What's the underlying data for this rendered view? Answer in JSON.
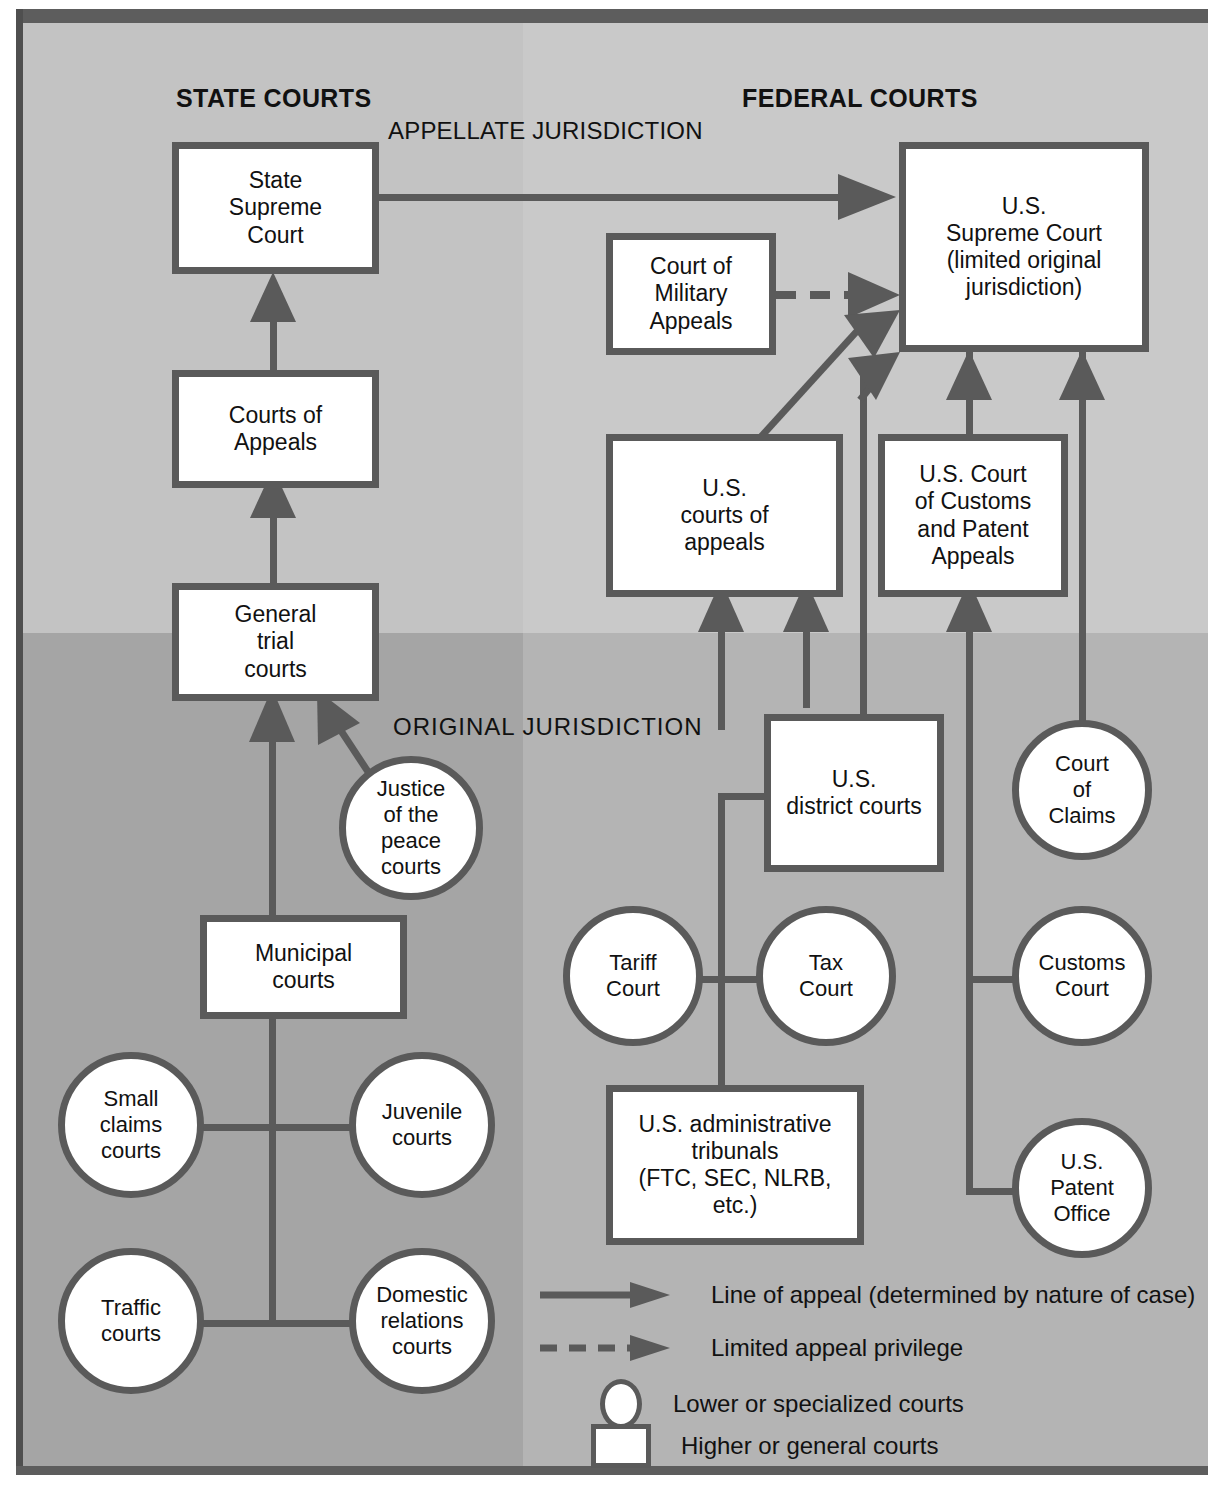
{
  "diagram": {
    "headers": {
      "state": "STATE COURTS",
      "federal": "FEDERAL COURTS",
      "appellate": "APPELLATE JURISDICTION",
      "original": "ORIGINAL JURISDICTION"
    },
    "colors": {
      "node_border": "#5a5a5a",
      "node_fill": "#ffffff",
      "bg_appellate_state": "#c3c3c3",
      "bg_appellate_federal": "#c9c9c9",
      "bg_original_state": "#a5a5a5",
      "bg_original_federal": "#b4b4b4",
      "frame": "#5d5d5d",
      "text": "#111111"
    },
    "state_nodes": [
      {
        "id": "state-supreme-court",
        "label": "State\nSupreme\nCourt",
        "shape": "box"
      },
      {
        "id": "courts-of-appeals",
        "label": "Courts of\nAppeals",
        "shape": "box"
      },
      {
        "id": "general-trial-courts",
        "label": "General\ntrial\ncourts",
        "shape": "box"
      },
      {
        "id": "justice-of-the-peace",
        "label": "Justice\nof the\npeace\ncourts",
        "shape": "circle"
      },
      {
        "id": "municipal-courts",
        "label": "Municipal\ncourts",
        "shape": "box"
      },
      {
        "id": "small-claims-courts",
        "label": "Small\nclaims\ncourts",
        "shape": "circle"
      },
      {
        "id": "juvenile-courts",
        "label": "Juvenile\ncourts",
        "shape": "circle"
      },
      {
        "id": "traffic-courts",
        "label": "Traffic\ncourts",
        "shape": "circle"
      },
      {
        "id": "domestic-relations",
        "label": "Domestic\nrelations\ncourts",
        "shape": "circle"
      }
    ],
    "federal_nodes": [
      {
        "id": "us-supreme-court",
        "label": "U.S.\nSupreme Court\n(limited original\njurisdiction)",
        "shape": "box"
      },
      {
        "id": "court-military-appeals",
        "label": "Court of\nMilitary\nAppeals",
        "shape": "box"
      },
      {
        "id": "us-courts-of-appeals",
        "label": "U.S.\ncourts of\nappeals",
        "shape": "box"
      },
      {
        "id": "us-court-customs-patent",
        "label": "U.S. Court\nof Customs\nand Patent\nAppeals",
        "shape": "box"
      },
      {
        "id": "us-district-courts",
        "label": "U.S.\ndistrict courts",
        "shape": "box"
      },
      {
        "id": "court-of-claims",
        "label": "Court\nof\nClaims",
        "shape": "circle"
      },
      {
        "id": "tariff-court",
        "label": "Tariff\nCourt",
        "shape": "circle"
      },
      {
        "id": "tax-court",
        "label": "Tax\nCourt",
        "shape": "circle"
      },
      {
        "id": "customs-court",
        "label": "Customs\nCourt",
        "shape": "circle"
      },
      {
        "id": "us-patent-office",
        "label": "U.S.\nPatent\nOffice",
        "shape": "circle"
      },
      {
        "id": "us-admin-tribunals",
        "label": "U.S. administrative\ntribunals\n(FTC, SEC, NLRB,\netc.)",
        "shape": "box"
      }
    ],
    "legend": [
      {
        "id": "legend-line-of-appeal",
        "symbol": "solid-arrow",
        "label": "Line of appeal (determined by nature of case)"
      },
      {
        "id": "legend-limited-appeal",
        "symbol": "dashed-arrow",
        "label": "Limited appeal privilege"
      },
      {
        "id": "legend-lower-courts",
        "symbol": "circle",
        "label": "Lower or specialized courts"
      },
      {
        "id": "legend-higher-courts",
        "symbol": "square",
        "label": "Higher or general courts"
      }
    ],
    "edges": [
      {
        "from": "general-trial-courts",
        "to": "courts-of-appeals",
        "style": "solid"
      },
      {
        "from": "courts-of-appeals",
        "to": "state-supreme-court",
        "style": "solid"
      },
      {
        "from": "state-supreme-court",
        "to": "us-supreme-court",
        "style": "solid"
      },
      {
        "from": "justice-of-the-peace",
        "to": "general-trial-courts",
        "style": "solid"
      },
      {
        "from": "municipal-courts",
        "to": "general-trial-courts",
        "style": "solid"
      },
      {
        "from": "court-military-appeals",
        "to": "us-supreme-court",
        "style": "dashed"
      },
      {
        "from": "us-courts-of-appeals",
        "to": "us-supreme-court",
        "style": "solid"
      },
      {
        "from": "us-district-courts",
        "to": "us-supreme-court",
        "style": "solid"
      },
      {
        "from": "us-court-customs-patent",
        "to": "us-supreme-court",
        "style": "solid"
      },
      {
        "from": "court-of-claims",
        "to": "us-supreme-court",
        "style": "solid"
      },
      {
        "from": "us-district-courts",
        "to": "us-courts-of-appeals",
        "style": "solid"
      },
      {
        "from": "us-admin-tribunals",
        "to": "us-courts-of-appeals",
        "style": "solid"
      },
      {
        "from": "customs-court",
        "to": "us-court-customs-patent",
        "style": "solid"
      },
      {
        "from": "us-patent-office",
        "to": "us-court-customs-patent",
        "style": "solid"
      }
    ]
  }
}
